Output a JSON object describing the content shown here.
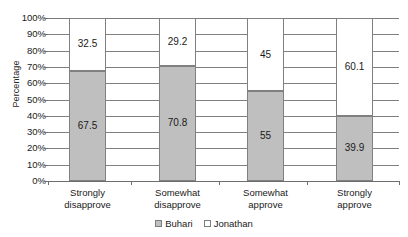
{
  "chart_data": {
    "type": "bar",
    "subtype": "stacked-100",
    "title": "",
    "xlabel": "",
    "ylabel": "Percentage",
    "ylim": [
      0,
      100
    ],
    "grid": true,
    "legend_position": "bottom",
    "categories": [
      "Strongly disapprove",
      "Somewhat disapprove",
      "Somewhat approve",
      "Strongly approve"
    ],
    "category_lines": [
      [
        "Strongly",
        "disapprove"
      ],
      [
        "Somewhat",
        "disapprove"
      ],
      [
        "Somewhat",
        "approve"
      ],
      [
        "Strongly",
        "approve"
      ]
    ],
    "series": [
      {
        "name": "Buhari",
        "color": "#bfbfbf",
        "values": [
          67.5,
          70.8,
          55,
          39.9
        ],
        "labels": [
          "67.5",
          "70.8",
          "55",
          "39.9"
        ]
      },
      {
        "name": "Jonathan",
        "color": "#ffffff",
        "values": [
          32.5,
          29.2,
          45,
          60.1
        ],
        "labels": [
          "32.5",
          "29.2",
          "45",
          "60.1"
        ]
      }
    ],
    "y_ticks": [
      "100%",
      "90%",
      "80%",
      "70%",
      "60%",
      "50%",
      "40%",
      "30%",
      "20%",
      "10%",
      "0%"
    ],
    "y_tick_values": [
      100,
      90,
      80,
      70,
      60,
      50,
      40,
      30,
      20,
      10,
      0
    ]
  },
  "legend": {
    "entries": [
      {
        "label": "Buhari",
        "swatch": "filled-gray"
      },
      {
        "label": "Jonathan",
        "swatch": "outlined-white"
      }
    ]
  },
  "colors": {
    "bar_fill": "#bfbfbf",
    "bar_stroke": "#808080",
    "gridline": "#808080",
    "axis": "#6e6e6e",
    "text": "#1a1a1a",
    "background": "#ffffff"
  }
}
